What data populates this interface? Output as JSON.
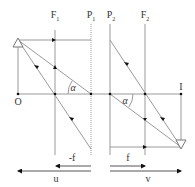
{
  "diagram": {
    "type": "thick-lens ray diagram",
    "labels": {
      "F1": "F",
      "F1_sub": "1",
      "P1": "P",
      "P1_sub": "1",
      "P2": "P",
      "P2_sub": "2",
      "F2": "F",
      "F2_sub": "2",
      "O": "O",
      "I": "I",
      "alpha_left": "α",
      "alpha_right": "α",
      "neg_f": "-f",
      "f": "f",
      "u": "u",
      "v": "v"
    },
    "colors": {
      "line": "#9a9a9a",
      "arrow": "#111111",
      "text": "#333333"
    }
  }
}
